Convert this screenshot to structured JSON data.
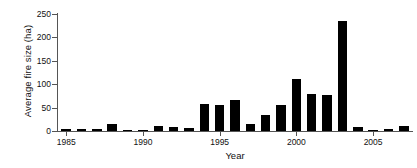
{
  "chart_data": {
    "type": "bar",
    "title": "",
    "xlabel": "Year",
    "ylabel": "Average fire size (ha)",
    "categories": [
      1985,
      1986,
      1987,
      1988,
      1989,
      1990,
      1991,
      1992,
      1993,
      1994,
      1995,
      1996,
      1997,
      1998,
      1999,
      2000,
      2001,
      2002,
      2003,
      2004,
      2005,
      2006,
      2007
    ],
    "values": [
      4,
      5,
      5,
      14,
      2,
      1,
      10,
      8,
      6,
      57,
      56,
      67,
      15,
      34,
      56,
      111,
      79,
      78,
      235,
      9,
      0.5,
      4,
      11
    ],
    "xlim": [
      1984.4,
      2007.6
    ],
    "ylim": [
      0,
      250
    ],
    "yticks": [
      0,
      50,
      100,
      150,
      200,
      250
    ],
    "ytick_labels": [
      "0",
      "50",
      "100",
      "150",
      "200",
      "250"
    ],
    "xticks": [
      1985,
      1990,
      1995,
      2000,
      2005
    ],
    "xtick_labels": [
      "1985",
      "1990",
      "1995",
      "2000",
      "2005"
    ],
    "grid": false,
    "legend": null,
    "bar_color": "#000000",
    "axis_color": "#555555",
    "background": "#ffffff"
  }
}
